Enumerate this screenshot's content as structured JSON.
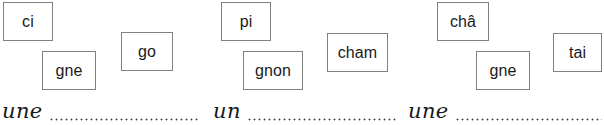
{
  "worksheet": {
    "exercise_type": "syllable-matching-fill-in-the-blank",
    "groups": [
      {
        "id": "group-1",
        "tiles": [
          {
            "label": "ci",
            "x": 3,
            "y": 2,
            "w": 50,
            "h": 39
          },
          {
            "label": "gne",
            "x": 42,
            "y": 51,
            "w": 54,
            "h": 39
          },
          {
            "label": "go",
            "x": 121,
            "y": 32,
            "w": 52,
            "h": 39
          }
        ],
        "prompt": "une",
        "prompt_x": 2,
        "prompt_y": 92,
        "prompt_w": 196
      },
      {
        "id": "group-2",
        "tiles": [
          {
            "label": "pi",
            "x": 221,
            "y": 2,
            "w": 50,
            "h": 39
          },
          {
            "label": "gnon",
            "x": 243,
            "y": 51,
            "w": 60,
            "h": 39
          },
          {
            "label": "cham",
            "x": 327,
            "y": 33,
            "w": 61,
            "h": 39
          }
        ],
        "prompt": "un",
        "prompt_x": 213,
        "prompt_y": 92,
        "prompt_w": 185
      },
      {
        "id": "group-3",
        "tiles": [
          {
            "label": "châ",
            "x": 437,
            "y": 2,
            "w": 52,
            "h": 39
          },
          {
            "label": "gne",
            "x": 476,
            "y": 51,
            "w": 54,
            "h": 39
          },
          {
            "label": "tai",
            "x": 553,
            "y": 33,
            "w": 49,
            "h": 39
          }
        ],
        "prompt": "une",
        "prompt_x": 408,
        "prompt_y": 92,
        "prompt_w": 194
      }
    ],
    "colors": {
      "tile_border": "#808080",
      "tile_text": "#1a1a1a",
      "page_background": "#ffffff",
      "dot_color": "#3a3a3a",
      "handwriting_text": "#15181c"
    }
  }
}
